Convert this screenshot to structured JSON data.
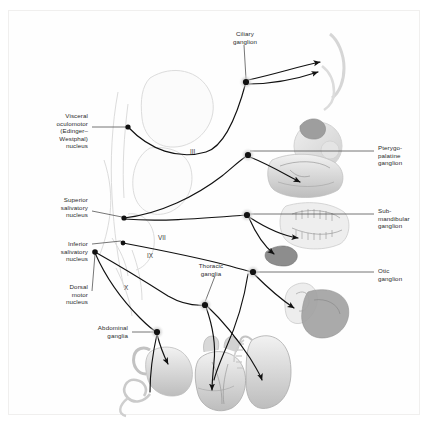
{
  "figure": {
    "background_color": "#ffffff",
    "frame_color": "#f0efee",
    "text_color": "#2b2b2b",
    "path_color": "#1a1a1a",
    "anatomy_color": "#d9d9d9",
    "ganglion_fill": "#111111",
    "ganglion_halo": "#c9c9c9"
  },
  "labels_left": [
    {
      "name": "visceral-oculomotor-nucleus",
      "text": "Visceral\noculomotor\n(Edinger–\nWestphal)\nnucleus",
      "x": 16,
      "y": 112,
      "w": 72
    },
    {
      "name": "superior-salivatory-nucleus",
      "text": "Superior\nsalivatory\nnucleus",
      "x": 16,
      "y": 196,
      "w": 72
    },
    {
      "name": "inferior-salivatory-nucleus",
      "text": "Inferior\nsalivatory\nnucleus",
      "x": 16,
      "y": 240,
      "w": 72
    },
    {
      "name": "dorsal-motor-nucleus",
      "text": "Dorsal\nmotor\nnucleus",
      "x": 16,
      "y": 283,
      "w": 72
    },
    {
      "name": "abdominal-ganglia",
      "text": "Abdominal\nganglia",
      "x": 62,
      "y": 320,
      "w": 66
    }
  ],
  "labels_right": [
    {
      "name": "pterygopalatine-ganglion",
      "text": "Pterygo-\npalatine\nganglion",
      "x": 378,
      "y": 144
    },
    {
      "name": "submandibular-ganglion",
      "text": "Sub-\nmandibular\nganglion",
      "x": 378,
      "y": 207
    },
    {
      "name": "otic-ganglion",
      "text": "Otic\nganglion",
      "x": 378,
      "y": 267
    }
  ],
  "labels_center": [
    {
      "name": "ciliary-ganglion",
      "text": "Ciliary\nganglion",
      "x": 215,
      "y": 30,
      "w": 60
    },
    {
      "name": "thoracic-ganglia",
      "text": "Thoracic\nganglia",
      "x": 182,
      "y": 262,
      "w": 58
    }
  ],
  "cranial_nerves": [
    {
      "name": "cranial-nerve-iii",
      "text": "III",
      "x": 190,
      "y": 148
    },
    {
      "name": "cranial-nerve-vii",
      "text": "VII",
      "x": 158,
      "y": 234
    },
    {
      "name": "cranial-nerve-ix",
      "text": "IX",
      "x": 147,
      "y": 252
    },
    {
      "name": "cranial-nerve-x",
      "text": "X",
      "x": 124,
      "y": 284
    }
  ],
  "organs": [
    {
      "name": "eye-illustration",
      "label": "eye"
    },
    {
      "name": "lacrimal-gland-illustration",
      "label": "lacrimal gland"
    },
    {
      "name": "nasal-palatine-mucosa-illustration",
      "label": "nasal and palatine mucosa"
    },
    {
      "name": "teeth-jaw-illustration",
      "label": "jaw and teeth"
    },
    {
      "name": "submandibular-sublingual-gland-illustration",
      "label": "submandibular and sublingual glands"
    },
    {
      "name": "ear-parotid-gland-illustration",
      "label": "ear and parotid gland"
    },
    {
      "name": "stomach-intestine-illustration",
      "label": "stomach and intestine"
    },
    {
      "name": "heart-illustration",
      "label": "heart"
    },
    {
      "name": "lung-illustration",
      "label": "lung"
    },
    {
      "name": "brainstem-illustration",
      "label": "brainstem"
    }
  ],
  "nodes": [
    {
      "name": "node-visceral-oculomotor",
      "x": 128,
      "y": 127
    },
    {
      "name": "node-superior-salivatory",
      "x": 124,
      "y": 218
    },
    {
      "name": "node-inferior-salivatory",
      "x": 123,
      "y": 243
    },
    {
      "name": "node-dorsal-motor",
      "x": 95,
      "y": 252
    },
    {
      "name": "node-ciliary-ganglion",
      "x": 246,
      "y": 82
    },
    {
      "name": "node-pterygopalatine-ganglion",
      "x": 248,
      "y": 155
    },
    {
      "name": "node-submandibular-ganglion",
      "x": 247,
      "y": 215
    },
    {
      "name": "node-otic-ganglion",
      "x": 253,
      "y": 272
    },
    {
      "name": "node-thoracic-ganglion-upper",
      "x": 247,
      "y": 272
    },
    {
      "name": "node-thoracic-ganglia",
      "x": 205,
      "y": 305
    },
    {
      "name": "node-abdominal-ganglia",
      "x": 157,
      "y": 332
    }
  ]
}
